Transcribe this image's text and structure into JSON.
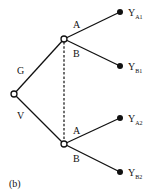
{
  "panel_label": "(b)",
  "root": {
    "label_upper": "G",
    "label_lower": "V"
  },
  "upper_node": {
    "label_upper": "A",
    "label_lower": "B"
  },
  "lower_node": {
    "label_upper": "A",
    "label_lower": "B"
  },
  "leaves": [
    {
      "main": "Y",
      "sub": "A1"
    },
    {
      "main": "Y",
      "sub": "B1"
    },
    {
      "main": "Y",
      "sub": "A2"
    },
    {
      "main": "Y",
      "sub": "B2"
    }
  ],
  "colors": {
    "line": "#111111",
    "background": "#ffffff"
  }
}
